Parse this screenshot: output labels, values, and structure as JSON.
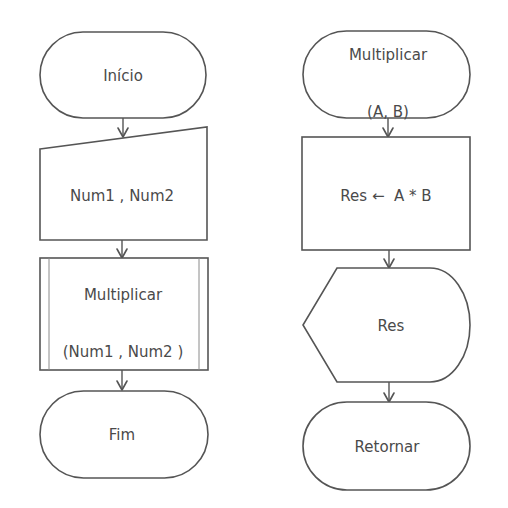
{
  "diagram": {
    "type": "flowchart",
    "colors": {
      "stroke": "#555555",
      "text": "#4a4a4a",
      "background": "#ffffff"
    },
    "main_flow": {
      "nodes": [
        {
          "id": "inicio",
          "shape": "terminator",
          "label": "Início"
        },
        {
          "id": "input",
          "shape": "manual-input",
          "label": "Num1 , Num2"
        },
        {
          "id": "call",
          "shape": "predefined-process",
          "label_line1": "Multiplicar",
          "label_line2": "(Num1 , Num2 )"
        },
        {
          "id": "fim",
          "shape": "terminator",
          "label": "Fim"
        }
      ],
      "edges": [
        [
          "inicio",
          "input"
        ],
        [
          "input",
          "call"
        ],
        [
          "call",
          "fim"
        ]
      ]
    },
    "subroutine": {
      "nodes": [
        {
          "id": "sub-start",
          "shape": "terminator",
          "label_line1": "Multiplicar",
          "label_line2": "(A, B)"
        },
        {
          "id": "assign",
          "shape": "process",
          "label": "Res ←  A * B"
        },
        {
          "id": "display",
          "shape": "display",
          "label": "Res"
        },
        {
          "id": "retornar",
          "shape": "terminator",
          "label": "Retornar"
        }
      ],
      "edges": [
        [
          "sub-start",
          "assign"
        ],
        [
          "assign",
          "display"
        ],
        [
          "display",
          "retornar"
        ]
      ]
    }
  }
}
